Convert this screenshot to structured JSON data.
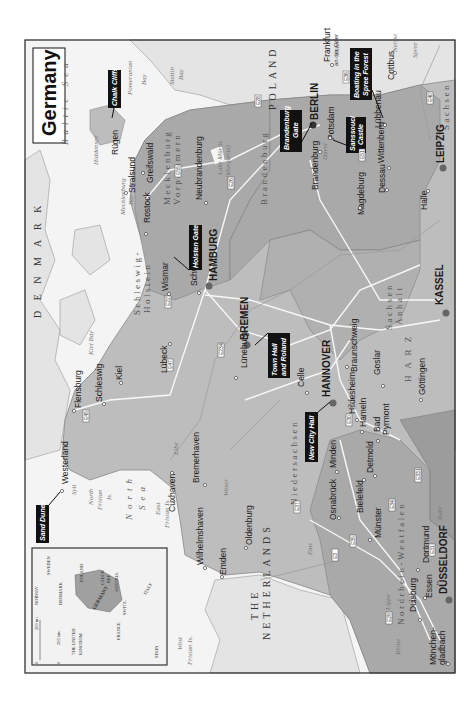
{
  "map": {
    "title": "Germany",
    "colors": {
      "germany_fill": "#bdbdbd",
      "state_fill_dark": "#a6a6a6",
      "neighbor_fill": "#e4e4e4",
      "water": "#f4f4f4",
      "road": "#f8f8f8",
      "callout_bg": "#111111",
      "city_dot": "#555555"
    },
    "countries": [
      {
        "label": "D E N M A R K"
      },
      {
        "label": "POLAND"
      },
      {
        "label": "THE"
      },
      {
        "label": "NETHERLANDS"
      }
    ],
    "regions": [
      {
        "label": "Schleswig-"
      },
      {
        "label": "Holstein"
      },
      {
        "label": "Mecklenburg"
      },
      {
        "label": "Vorpommern"
      },
      {
        "label": "Brandenburg"
      },
      {
        "label": "Niedersachsen"
      },
      {
        "label": "Sachsen"
      },
      {
        "label": "Anhalt"
      },
      {
        "label": "Sachsen"
      },
      {
        "label": "Nordrhein-Westfalen"
      },
      {
        "label": "H A R Z"
      }
    ],
    "water": [
      {
        "label": "Baltic Sea"
      },
      {
        "label": "North"
      },
      {
        "label": "Sea"
      },
      {
        "label": "Pomeranian"
      },
      {
        "label": "Bay"
      },
      {
        "label": "Stettin"
      },
      {
        "label": "Bay"
      },
      {
        "label": "Mecklenburg"
      },
      {
        "label": "Bay"
      },
      {
        "label": "Kiel Bay"
      },
      {
        "label": "Hiddensee"
      },
      {
        "label": "Lake Müritz"
      },
      {
        "label": "(Margaritz)"
      },
      {
        "label": "Elbe"
      },
      {
        "label": "Weser"
      },
      {
        "label": "Ems"
      },
      {
        "label": "Aller"
      },
      {
        "label": "Oder"
      },
      {
        "label": "Neisse"
      },
      {
        "label": "Spree"
      },
      {
        "label": "Havel"
      },
      {
        "label": "Lippe"
      },
      {
        "label": "Rhine"
      },
      {
        "label": "Ruhr"
      },
      {
        "label": "North"
      },
      {
        "label": "Frisian"
      },
      {
        "label": "Is."
      },
      {
        "label": "East"
      },
      {
        "label": "Frisian Is."
      },
      {
        "label": "West"
      },
      {
        "label": "Frisian Is."
      },
      {
        "label": "Sylt"
      }
    ],
    "major_cities": [
      {
        "label": "BERLIN"
      },
      {
        "label": "HAMBURG"
      },
      {
        "label": "BREMEN"
      },
      {
        "label": "HANNOVER"
      },
      {
        "label": "LEIPZIG"
      },
      {
        "label": "KASSEL"
      },
      {
        "label": "DÜSSELDORF"
      }
    ],
    "cities": [
      {
        "label": "Westerland"
      },
      {
        "label": "Flensburg"
      },
      {
        "label": "Schleswig"
      },
      {
        "label": "Kiel"
      },
      {
        "label": "Lübeck"
      },
      {
        "label": "Wismar"
      },
      {
        "label": "Rostock"
      },
      {
        "label": "Stralsund"
      },
      {
        "label": "Greifswald"
      },
      {
        "label": "Rügen"
      },
      {
        "label": "Schwerin"
      },
      {
        "label": "Neubrandenburg"
      },
      {
        "label": "Lüneburg"
      },
      {
        "label": "Celle"
      },
      {
        "label": "Braunschweig"
      },
      {
        "label": "Goslar"
      },
      {
        "label": "Göttingen"
      },
      {
        "label": "Hildesheim"
      },
      {
        "label": "Hameln"
      },
      {
        "label": "Bad"
      },
      {
        "label": "Pyrmont"
      },
      {
        "label": "Cuxhaven"
      },
      {
        "label": "Bremerhaven"
      },
      {
        "label": "Wilhelmshaven"
      },
      {
        "label": "Emden"
      },
      {
        "label": "Oldenburg"
      },
      {
        "label": "Osnabrück"
      },
      {
        "label": "Minden"
      },
      {
        "label": "Bielefeld"
      },
      {
        "label": "Detmold"
      },
      {
        "label": "Münster"
      },
      {
        "label": "Dortmund"
      },
      {
        "label": "Essen"
      },
      {
        "label": "Duisburg"
      },
      {
        "label": "Mönchen-"
      },
      {
        "label": "gladbach"
      },
      {
        "label": "Brandenburg"
      },
      {
        "label": "Potsdam"
      },
      {
        "label": "Magdeburg"
      },
      {
        "label": "Dessau"
      },
      {
        "label": "Wittenberg"
      },
      {
        "label": "Halle"
      },
      {
        "label": "Lübbenau"
      },
      {
        "label": "Cottbus"
      },
      {
        "label": "Frankfurt"
      },
      {
        "label": "an der Oder"
      }
    ],
    "callouts": [
      {
        "label": "Sand Dunes"
      },
      {
        "label": "Chalk Cliffs"
      },
      {
        "label": "Holsten Gate"
      },
      {
        "label": "Brandenburg"
      },
      {
        "label": "Gate"
      },
      {
        "label": "Sanssouci"
      },
      {
        "label": "Castle"
      },
      {
        "label": "Boating in the"
      },
      {
        "label": "Spree Forest"
      },
      {
        "label": "Town Hall"
      },
      {
        "label": "and Roland"
      },
      {
        "label": "New City Hall"
      }
    ],
    "roads": [
      "E45",
      "E47",
      "E22",
      "E26",
      "E55",
      "E28",
      "E30",
      "E51",
      "E40",
      "E36",
      "E234",
      "E37",
      "E35",
      "E331",
      "E34",
      "E31",
      "E29",
      "E3"
    ],
    "inset": {
      "scale_mi": "200 mi",
      "scale_km": "200 km",
      "zero": "0",
      "labels": [
        {
          "label": "NORWAY"
        },
        {
          "label": "SWEDEN"
        },
        {
          "label": "DENMARK"
        },
        {
          "label": "THE UNITED"
        },
        {
          "label": "KINGDOM"
        },
        {
          "label": "POLAND"
        },
        {
          "label": "GERMANY"
        },
        {
          "label": "CZECH"
        },
        {
          "label": "REP."
        },
        {
          "label": "AUSTRIA"
        },
        {
          "label": "SWITZ."
        },
        {
          "label": "FRANCE"
        },
        {
          "label": "ITALY"
        },
        {
          "label": "SPAIN"
        }
      ]
    }
  }
}
